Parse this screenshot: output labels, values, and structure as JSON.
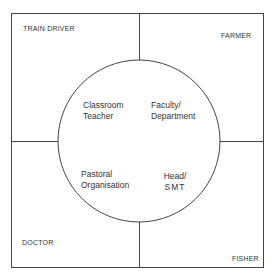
{
  "diagram": {
    "corners": {
      "top_left": "TRAIN DRIVER",
      "top_right": "FARMER",
      "bottom_left": "DOCTOR",
      "bottom_right": "FISHER"
    },
    "circle_quadrants": {
      "top_left": [
        "Classroom",
        "Teacher"
      ],
      "top_right": [
        "Faculty/",
        "Department"
      ],
      "bottom_left": [
        "Pastoral",
        "Organisation"
      ],
      "bottom_right": [
        "Head/",
        "SMT"
      ]
    },
    "colors": {
      "line": "#444444",
      "text": "#333333",
      "background": "#ffffff"
    }
  }
}
